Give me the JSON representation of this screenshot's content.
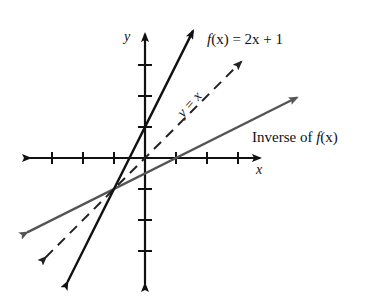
{
  "figure": {
    "title": "",
    "axes": {
      "x_label": "x",
      "y_label": "y",
      "origin_px": [
        145,
        158
      ],
      "unit_px": 31,
      "x_ticks": [
        -3,
        -2,
        -1,
        1,
        2,
        3
      ],
      "y_ticks": [
        -3,
        -2,
        -1,
        1,
        2,
        3
      ]
    },
    "curves": [
      {
        "name": "f",
        "label_f": "f",
        "label_rest": "(x) = 2x + 1",
        "equation": "f(x) = 2x + 1",
        "style": "solid",
        "color": "#111111",
        "x_range": [
          -2.5,
          1.55
        ]
      },
      {
        "name": "identity",
        "label": "y = x",
        "equation": "y = x",
        "style": "dashed",
        "color": "#222222",
        "x_range": [
          -3.2,
          3.1
        ]
      },
      {
        "name": "inverse",
        "label_text": "Inverse of ",
        "label_f": "f",
        "label_rest": "(x)",
        "equation": "y = (x - 1)/2",
        "style": "solid",
        "color": "#555555",
        "x_range": [
          -3.8,
          4.9
        ]
      }
    ]
  }
}
